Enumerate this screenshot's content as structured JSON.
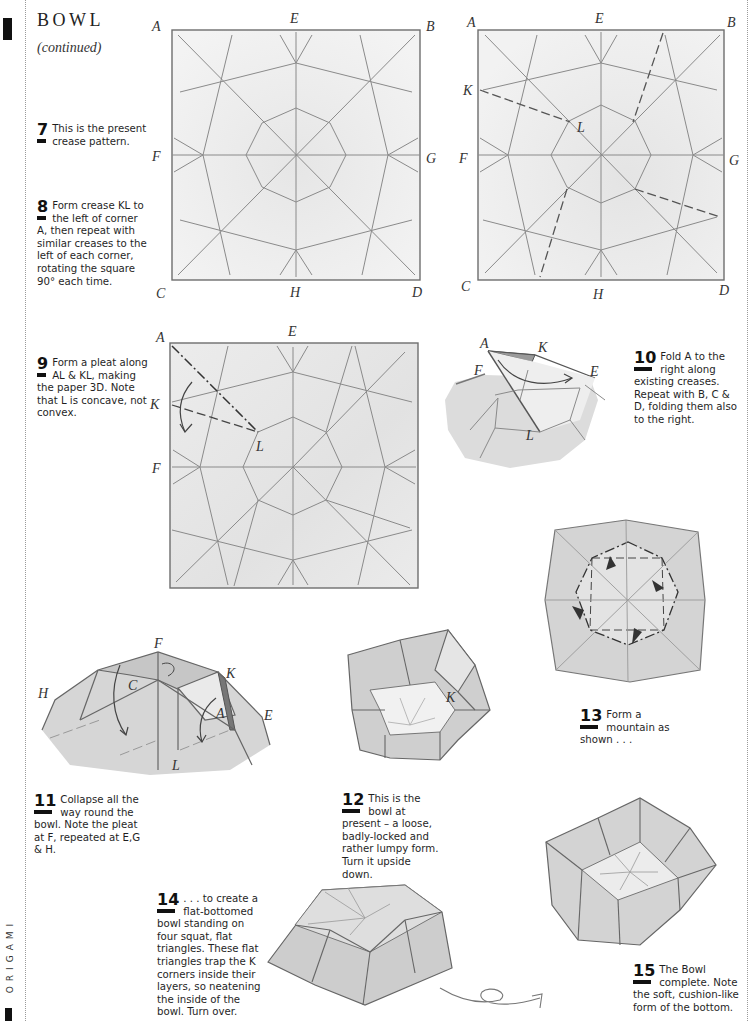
{
  "page": {
    "title": "BOWL",
    "subtitle": "(continued)",
    "side_label": "ORIGAMI"
  },
  "steps": [
    {
      "number": "7",
      "text": "This is the present crease pattern."
    },
    {
      "number": "8",
      "text": "Form crease KL to the left of corner A, then repeat with similar creases to the left of each corner, rotating the square 90° each time."
    },
    {
      "number": "9",
      "text": "Form a pleat along AL & KL, making the paper 3D. Note that L is concave, not convex."
    },
    {
      "number": "10",
      "text": "Fold A to the right along existing creases. Repeat with B, C & D, folding them also to the right."
    },
    {
      "number": "11",
      "text": "Collapse all the way round the bowl. Note the pleat at F, repeated at E,G & H."
    },
    {
      "number": "12",
      "text": "This is the bowl at present – a loose, badly-locked and rather lumpy form. Turn it upside down."
    },
    {
      "number": "13",
      "text": "Form a mountain as shown . . ."
    },
    {
      "number": "14",
      "text": ". . . to create a flat-bottomed bowl standing on four squat, flat triangles. These flat triangles trap the K corners inside their layers, so neatening the inside of the bowl. Turn over."
    },
    {
      "number": "15",
      "text": "The Bowl complete. Note the soft, cushion-like form of the bottom."
    }
  ],
  "figures": {
    "fig7": {
      "labels": {
        "A": "A",
        "B": "B",
        "C": "C",
        "D": "D",
        "E": "E",
        "F": "F",
        "G": "G",
        "H": "H"
      }
    },
    "fig8": {
      "labels": {
        "A": "A",
        "B": "B",
        "C": "C",
        "D": "D",
        "E": "E",
        "F": "F",
        "G": "G",
        "H": "H",
        "K": "K",
        "L": "L"
      }
    },
    "fig9": {
      "labels": {
        "A": "A",
        "E": "E",
        "K": "K",
        "F": "F",
        "L": "L"
      }
    },
    "fig10": {
      "labels": {
        "A": "A",
        "K": "K",
        "F": "F",
        "E": "E",
        "L": "L"
      }
    },
    "fig11": {
      "labels": {
        "F": "F",
        "K": "K",
        "H": "H",
        "C": "C",
        "A": "A",
        "E": "E",
        "L": "L"
      }
    },
    "fig12": {
      "labels": {
        "K": "K"
      }
    }
  },
  "colors": {
    "ink": "#111111",
    "crease": "#7a7a7a",
    "paper_light": "#efefef",
    "paper_shade": "#cfcfcf",
    "paper_dark": "#b5b5b5"
  }
}
